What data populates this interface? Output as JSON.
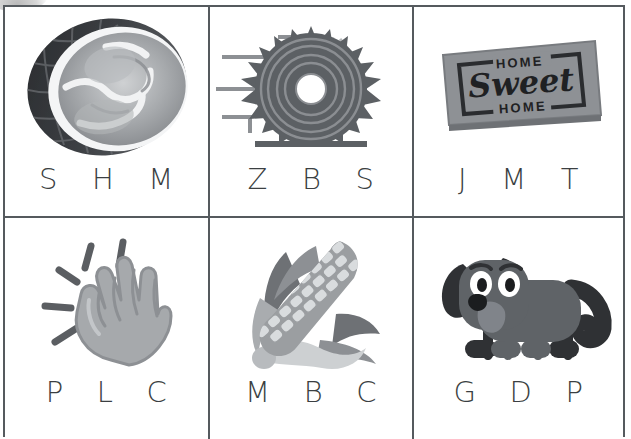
{
  "worksheet": {
    "type": "beginning-sound-multiple-choice-worksheet",
    "rows": 2,
    "columns": 3,
    "cells": [
      {
        "id": "cell-1",
        "picture_name": "snail-shell",
        "picture_label": "snail shell",
        "choices": [
          "S",
          "H",
          "M"
        ]
      },
      {
        "id": "cell-2",
        "picture_name": "circular-saw-blade",
        "picture_label": "saw blade",
        "choices": [
          "Z",
          "B",
          "S"
        ]
      },
      {
        "id": "cell-3",
        "picture_name": "welcome-doormat",
        "picture_label": "doormat",
        "doormat_text": {
          "top": "HOME",
          "middle": "Sweet",
          "bottom": "HOME"
        },
        "choices": [
          "J",
          "M",
          "T"
        ]
      },
      {
        "id": "cell-4",
        "picture_name": "clapping-hand",
        "picture_label": "clapping hand",
        "choices": [
          "P",
          "L",
          "C"
        ]
      },
      {
        "id": "cell-5",
        "picture_name": "corn-cob",
        "picture_label": "corn on the cob",
        "choices": [
          "M",
          "B",
          "C"
        ]
      },
      {
        "id": "cell-6",
        "picture_name": "dog",
        "picture_label": "dog",
        "choices": [
          "G",
          "D",
          "P"
        ]
      }
    ]
  },
  "colors": {
    "grid_line": "#555a5e",
    "letter_text": "#3b3f42",
    "background": "#ffffff",
    "dark_gray": "#3f4246",
    "mid_gray": "#6f7276",
    "light_gray": "#b4b7ba",
    "pale_gray": "#d8dadc"
  }
}
